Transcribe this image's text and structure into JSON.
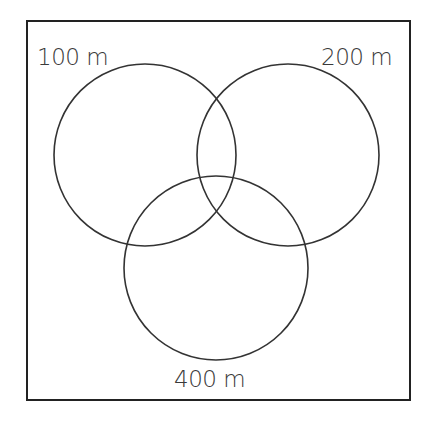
{
  "diagram": {
    "type": "venn",
    "frame": {
      "x": 27,
      "y": 21,
      "width": 383,
      "height": 379,
      "stroke": "#222222"
    },
    "circles": [
      {
        "id": "c100",
        "label": "100 m",
        "cx": 145,
        "cy": 155,
        "r": 91
      },
      {
        "id": "c200",
        "label": "200 m",
        "cx": 288,
        "cy": 155,
        "r": 91
      },
      {
        "id": "c400",
        "label": "400 m",
        "cx": 216,
        "cy": 268,
        "r": 92
      }
    ],
    "stroke_color": "#333333"
  },
  "labels": {
    "top_left": "100 m",
    "top_right": "200 m",
    "bottom": "400 m"
  }
}
